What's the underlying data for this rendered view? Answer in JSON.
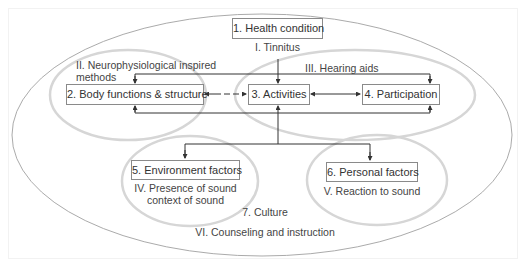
{
  "nodes": {
    "health_condition": {
      "label": "1. Health condition",
      "intervention": "I. Tinnitus"
    },
    "body_functions": {
      "label": "2. Body functions & structure",
      "intervention_line1": "II. Neurophysiological inspired",
      "intervention_line2": "methods"
    },
    "activities": {
      "label": "3. Activities"
    },
    "participation": {
      "label": "4. Participation",
      "intervention": "III. Hearing aids"
    },
    "environment_factors": {
      "label": "5. Environment factors",
      "intervention_line1": "IV. Presence of sound",
      "intervention_line2": "context of sound"
    },
    "personal_factors": {
      "label": "6. Personal factors",
      "intervention": "V. Reaction to sound"
    },
    "culture": {
      "label": "7. Culture",
      "intervention": "VI. Counseling and instruction"
    }
  },
  "colors": {
    "box_border": "#8a8a8a",
    "arrow": "#333333",
    "inner_ellipse": "#d4d4d4",
    "outer_ellipse": "#9a9a9a"
  }
}
